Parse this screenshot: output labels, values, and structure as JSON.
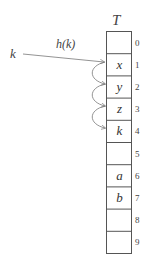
{
  "diagram": {
    "table_label": "T",
    "key_label": "k",
    "hash_label": "h(k)",
    "rows": [
      {
        "index": "0",
        "value": ""
      },
      {
        "index": "1",
        "value": "x"
      },
      {
        "index": "2",
        "value": "y"
      },
      {
        "index": "3",
        "value": "z"
      },
      {
        "index": "4",
        "value": "k"
      },
      {
        "index": "5",
        "value": ""
      },
      {
        "index": "6",
        "value": "a"
      },
      {
        "index": "7",
        "value": "b"
      },
      {
        "index": "8",
        "value": ""
      },
      {
        "index": "9",
        "value": ""
      }
    ],
    "hash_arrow": {
      "from": "k",
      "to_row": 1
    },
    "probe_arrows": [
      {
        "from_row": 1,
        "to_row": 2
      },
      {
        "from_row": 2,
        "to_row": 3
      },
      {
        "from_row": 3,
        "to_row": 4
      }
    ],
    "colors": {
      "line": "#555555",
      "arrow": "#777777",
      "text": "#333333"
    }
  }
}
